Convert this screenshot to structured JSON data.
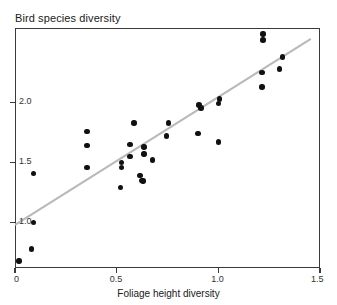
{
  "chart_data": {
    "type": "scatter",
    "title": "Bird species diversity",
    "xlabel": "Foliage height diversity",
    "ylabel": "Bird species diversity",
    "xlim": [
      0,
      1.5
    ],
    "ylim": [
      0.62,
      2.62
    ],
    "grid": false,
    "legend": null,
    "xticks": [
      0,
      0.5,
      1.0,
      1.5
    ],
    "xtick_labels": [
      "0",
      "0.5",
      "1.0",
      "1.5"
    ],
    "yticks": [
      1.0,
      1.5,
      2.0
    ],
    "ytick_labels": [
      "1.0",
      "1.5",
      "2.0"
    ],
    "points": [
      {
        "x": 0.02,
        "y": 0.68
      },
      {
        "x": 0.08,
        "y": 0.78
      },
      {
        "x": 0.09,
        "y": 1.0
      },
      {
        "x": 0.09,
        "y": 1.41
      },
      {
        "x": 0.355,
        "y": 1.46
      },
      {
        "x": 0.355,
        "y": 1.64
      },
      {
        "x": 0.355,
        "y": 1.76
      },
      {
        "x": 0.52,
        "y": 1.29
      },
      {
        "x": 0.525,
        "y": 1.46
      },
      {
        "x": 0.525,
        "y": 1.5
      },
      {
        "x": 0.565,
        "y": 1.55
      },
      {
        "x": 0.565,
        "y": 1.65
      },
      {
        "x": 0.585,
        "y": 1.83
      },
      {
        "x": 0.615,
        "y": 1.39
      },
      {
        "x": 0.625,
        "y": 1.35
      },
      {
        "x": 0.63,
        "y": 1.345
      },
      {
        "x": 0.635,
        "y": 1.57
      },
      {
        "x": 0.635,
        "y": 1.63
      },
      {
        "x": 0.675,
        "y": 1.52
      },
      {
        "x": 0.745,
        "y": 1.72
      },
      {
        "x": 0.755,
        "y": 1.83
      },
      {
        "x": 0.9,
        "y": 1.74
      },
      {
        "x": 0.905,
        "y": 1.98
      },
      {
        "x": 0.915,
        "y": 1.955
      },
      {
        "x": 1.0,
        "y": 1.67
      },
      {
        "x": 1.0,
        "y": 1.99
      },
      {
        "x": 1.005,
        "y": 2.03
      },
      {
        "x": 1.215,
        "y": 2.13
      },
      {
        "x": 1.215,
        "y": 2.25
      },
      {
        "x": 1.22,
        "y": 2.52
      },
      {
        "x": 1.22,
        "y": 2.57
      },
      {
        "x": 1.3,
        "y": 2.28
      },
      {
        "x": 1.315,
        "y": 2.38
      }
    ],
    "trend_line": {
      "style": "solid",
      "color": "#b9b9b9",
      "x_start": 0.0,
      "y_start": 0.98,
      "x_end": 1.455,
      "y_end": 2.53
    },
    "point_color": "#111111",
    "axis_color": "#3a3a3a"
  }
}
